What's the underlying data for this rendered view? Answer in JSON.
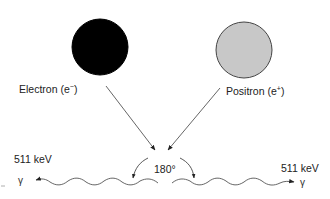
{
  "diagram": {
    "particles": [
      {
        "id": "electron",
        "label_prefix": "Electron (e",
        "label_charge": "−",
        "label_suffix": ")",
        "fill": "#000000",
        "stroke": "#000000"
      },
      {
        "id": "positron",
        "label_prefix": "Positron (e",
        "label_charge": "+",
        "label_suffix": ")",
        "fill": "#c8c8c8",
        "stroke": "#444444"
      }
    ],
    "annihilation": {
      "angle_label": "180°"
    },
    "photons": [
      {
        "side": "left",
        "energy_label": "511 keV",
        "symbol": "γ"
      },
      {
        "side": "right",
        "energy_label": "511 keV",
        "symbol": "γ"
      }
    ],
    "colors": {
      "line": "#555555",
      "arrowhead": "#222222",
      "text": "#222222"
    }
  }
}
